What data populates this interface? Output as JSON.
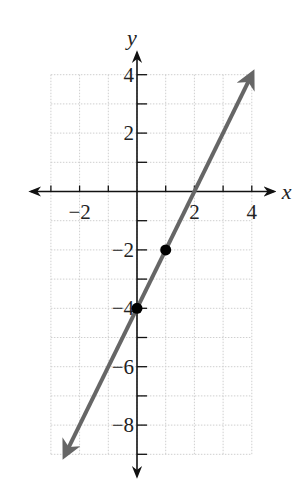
{
  "chart_data": {
    "type": "line",
    "title": "",
    "xlabel": "x",
    "ylabel": "y",
    "xlim": [
      -3,
      4
    ],
    "ylim": [
      -9,
      4
    ],
    "grid": true,
    "legend": null,
    "x_ticks": [
      -3,
      -2,
      -1,
      0,
      1,
      2,
      3,
      4
    ],
    "x_tick_labels": [
      {
        "value": -2,
        "label": "−2"
      },
      {
        "value": 2,
        "label": "2"
      },
      {
        "value": 4,
        "label": "4"
      }
    ],
    "y_ticks": [
      4,
      3,
      2,
      1,
      0,
      -1,
      -2,
      -3,
      -4,
      -5,
      -6,
      -7,
      -8,
      -9
    ],
    "y_tick_labels": [
      {
        "value": 4,
        "label": "4"
      },
      {
        "value": 2,
        "label": "2"
      },
      {
        "value": -2,
        "label": "−2"
      },
      {
        "value": -4,
        "label": "−4"
      },
      {
        "value": -6,
        "label": "−6"
      },
      {
        "value": -8,
        "label": "−8"
      }
    ],
    "series": [
      {
        "name": "y = 2x − 4",
        "kind": "line-with-arrows",
        "slope": 2,
        "intercept": -4,
        "x": [
          -2.5,
          4
        ],
        "y": [
          -9,
          4
        ],
        "color": "#666666"
      },
      {
        "name": "plotted points",
        "kind": "scatter",
        "points": [
          [
            0,
            -4
          ],
          [
            1,
            -2
          ]
        ],
        "color": "#000000"
      }
    ]
  },
  "colors": {
    "axis": "#111111",
    "grid": "#cfcfcf",
    "line": "#666666",
    "point": "#000000"
  }
}
